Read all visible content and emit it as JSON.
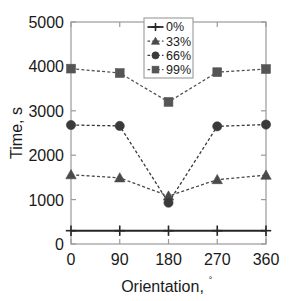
{
  "chart_data": {
    "type": "line",
    "title": "",
    "subtitle": "",
    "xlabel": "Orientation,",
    "xlabel_unit": "°",
    "ylabel": "Time, s",
    "x": [
      0,
      90,
      180,
      270,
      360
    ],
    "xticklabels": [
      "0",
      "90",
      "180",
      "270",
      "360"
    ],
    "yticklabels": [
      "0",
      "1000",
      "2000",
      "3000",
      "4000",
      "5000"
    ],
    "yticks": [
      0,
      1000,
      2000,
      3000,
      4000,
      5000
    ],
    "xlim": [
      0,
      360
    ],
    "ylim": [
      0,
      5000
    ],
    "grid": false,
    "legend_position": "top-center",
    "series": [
      {
        "name": "0%",
        "marker": "plus",
        "linestyle": "solid",
        "color": "#262626",
        "values": [
          300,
          300,
          300,
          300,
          300
        ]
      },
      {
        "name": "33%",
        "marker": "triangle",
        "linestyle": "dashed",
        "color": "#4a4a4a",
        "values": [
          1560,
          1490,
          1080,
          1450,
          1550
        ]
      },
      {
        "name": "66%",
        "marker": "circle",
        "linestyle": "dashed",
        "color": "#3a3a3a",
        "values": [
          2680,
          2660,
          930,
          2650,
          2690
        ]
      },
      {
        "name": "99%",
        "marker": "square",
        "linestyle": "dashed",
        "color": "#555555",
        "values": [
          3950,
          3850,
          3200,
          3870,
          3940
        ]
      }
    ]
  }
}
